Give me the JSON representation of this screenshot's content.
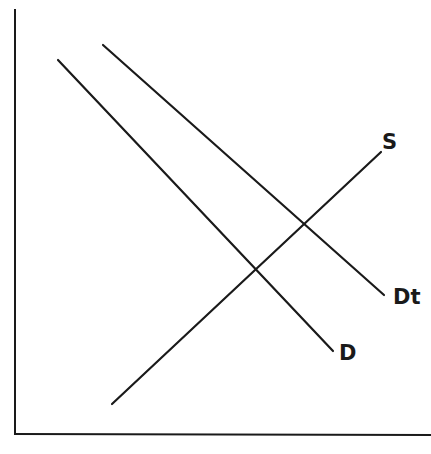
{
  "diagram": {
    "type": "supply-demand",
    "line_color": "#1a1a1a",
    "axes": {
      "origin": [
        15,
        434
      ],
      "y_top": [
        15,
        10
      ],
      "x_right": [
        431,
        435
      ]
    },
    "curves": [
      {
        "id": "D",
        "label": "D",
        "start": [
          58,
          60
        ],
        "end": [
          333,
          351
        ],
        "label_pos": [
          339,
          343
        ]
      },
      {
        "id": "Dt",
        "label": "Dt",
        "start": [
          103,
          45
        ],
        "end": [
          384,
          295
        ],
        "label_pos": [
          393,
          287
        ]
      },
      {
        "id": "S",
        "label": "S",
        "start": [
          112,
          404
        ],
        "end": [
          381,
          152
        ],
        "label_pos": [
          382,
          132
        ]
      }
    ],
    "intersections": [
      {
        "curves": [
          "S",
          "D"
        ],
        "point": [
          257,
          269
        ]
      },
      {
        "curves": [
          "S",
          "Dt"
        ],
        "point": [
          305,
          224
        ]
      }
    ]
  },
  "labels": {
    "demand": "D",
    "demand_shifted": "Dt",
    "supply": "S"
  }
}
